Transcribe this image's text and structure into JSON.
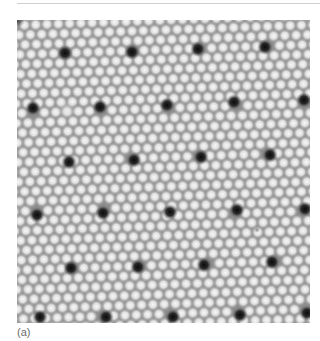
{
  "figure": {
    "caption": "(a)",
    "colors": {
      "background_gray": "#8c8c8c",
      "bright_spot": "#f2f2f2",
      "dark_hole": "#0e0e0e",
      "rule": "#cfcfcf",
      "caption_text": "#6a6a6a"
    },
    "image_box": {
      "x": 17,
      "y": 20,
      "width": 293,
      "height": 303
    },
    "spot_lattice": {
      "spacing_px": 11.3,
      "rotation_deg": -2,
      "spot_radius_px": 4.6
    },
    "holes": [
      [
        48,
        33
      ],
      [
        115,
        32
      ],
      [
        181,
        29
      ],
      [
        248,
        27
      ],
      [
        16,
        88
      ],
      [
        83,
        87
      ],
      [
        150,
        85
      ],
      [
        217,
        82
      ],
      [
        287,
        80
      ],
      [
        52,
        142
      ],
      [
        117,
        140
      ],
      [
        184,
        137
      ],
      [
        253,
        135
      ],
      [
        20,
        195
      ],
      [
        86,
        193
      ],
      [
        153,
        192
      ],
      [
        220,
        190
      ],
      [
        288,
        189
      ],
      [
        54,
        248
      ],
      [
        121,
        247
      ],
      [
        187,
        245
      ],
      [
        255,
        242
      ],
      [
        23,
        297
      ],
      [
        89,
        297
      ],
      [
        156,
        297
      ],
      [
        223,
        295
      ],
      [
        290,
        293
      ]
    ],
    "anomalies": [
      {
        "x": 50,
        "y": 90,
        "r": 9,
        "type": "bright-patch"
      },
      {
        "x": 240,
        "y": 210,
        "r": 3,
        "type": "defect"
      }
    ]
  }
}
